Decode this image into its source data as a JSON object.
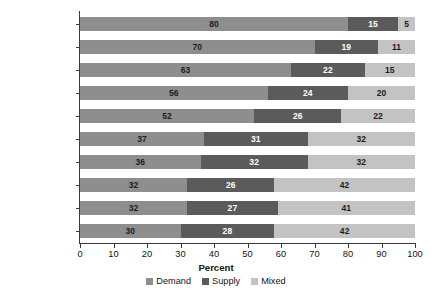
{
  "chart_data": {
    "type": "bar",
    "orientation": "horizontal",
    "stacked": true,
    "title": "",
    "xlabel": "Percent",
    "ylabel": "",
    "xlim": [
      0,
      100
    ],
    "xticks": [
      0,
      10,
      20,
      30,
      40,
      50,
      60,
      70,
      80,
      90,
      100
    ],
    "grid": false,
    "legend_position": "bottom-center",
    "categories": [
      "Central Africa",
      "Urban",
      "UMIC",
      "LMIC",
      "Southern Africa",
      "Africa",
      "West Africa",
      "East Africa",
      "Rural",
      "LIC"
    ],
    "series": [
      {
        "name": "Demand",
        "color": "#8e8e8e",
        "values": [
          80,
          70,
          63,
          56,
          52,
          37,
          36,
          32,
          32,
          30
        ]
      },
      {
        "name": "Supply",
        "color": "#5b5b5b",
        "values": [
          15,
          19,
          22,
          24,
          26,
          31,
          32,
          26,
          27,
          28
        ]
      },
      {
        "name": "Mixed",
        "color": "#c3c3c3",
        "values": [
          5,
          11,
          15,
          20,
          22,
          32,
          32,
          42,
          41,
          42
        ]
      }
    ]
  },
  "legend": {
    "items": [
      {
        "label": "Demand",
        "color": "#8e8e8e"
      },
      {
        "label": "Supply",
        "color": "#5b5b5b"
      },
      {
        "label": "Mixed",
        "color": "#c3c3c3"
      }
    ]
  }
}
